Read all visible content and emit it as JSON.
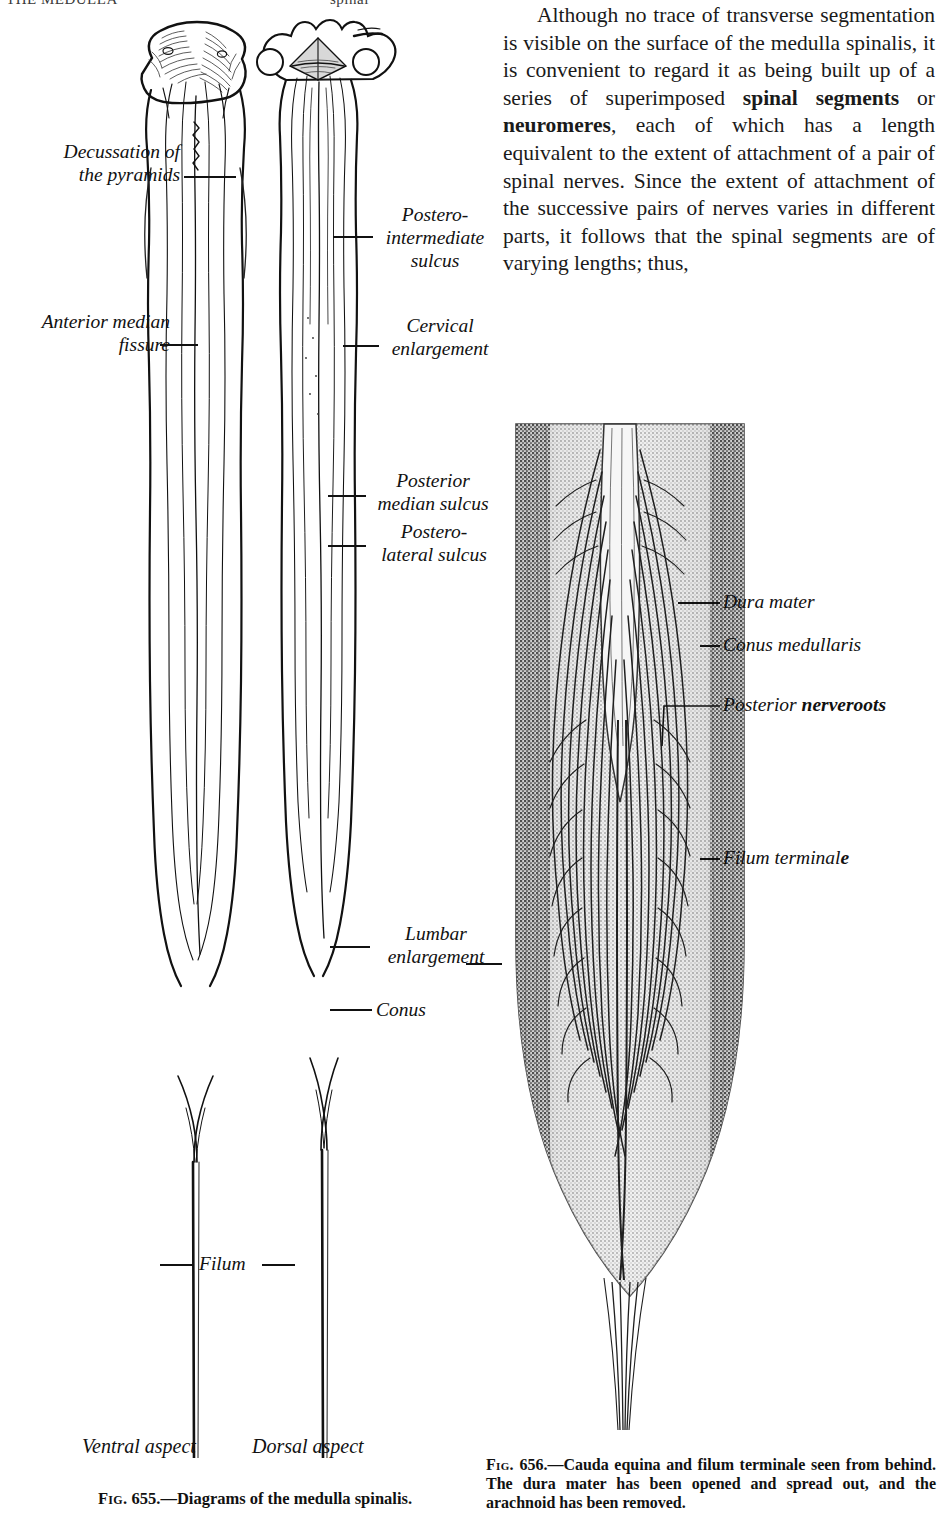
{
  "page": {
    "running_header_left": "THE MEDULLA",
    "running_header_right": "spinal"
  },
  "body_text": {
    "paragraph_html": "Although no trace of transverse segmentation is visible on the surface of the medulla spinalis, it is convenient to regard it as being built up of a series of superimposed <b>spinal segments</b> or <b>neuromeres</b>, each of which has a length equivalent to the extent of attachment of a pair of spinal nerves. Since the extent of attachment of the successive pairs of nerves varies in different parts, it follows that the spinal segments are of varying lengths; thus,"
  },
  "figure_655": {
    "caption_prefix": "Fig.",
    "caption_number": "655.",
    "caption_text": "—Diagrams of the medulla spinalis.",
    "aspect_left": "Ventral aspect",
    "aspect_right": "Dorsal aspect",
    "labels": {
      "decussation": "Decussation of\nthe pyramids",
      "decussation_line1": "Decussation of",
      "decussation_line2": "the pyramids",
      "anterior_median_line1": "Anterior median",
      "anterior_median_line2": "fissure",
      "postero_intermediate_line1": "Postero-",
      "postero_intermediate_line2": "intermediate",
      "postero_intermediate_line3": "sulcus",
      "cervical_line1": "Cervical",
      "cervical_line2": "enlargement",
      "posterior_median_line1": "Posterior",
      "posterior_median_line2": "median sulcus",
      "postero_lateral_line1": "Postero-",
      "postero_lateral_line2": "lateral sulcus",
      "lumbar_line1": "Lumbar",
      "lumbar_line2": "enlargement",
      "conus": "Conus",
      "filum": "Filum"
    }
  },
  "figure_656": {
    "caption_prefix": "Fig.",
    "caption_number": "656.",
    "caption_text": "—Cauda equina and filum terminale seen from behind. The dura mater has been opened and spread out, and the arachnoid has been removed.",
    "labels": {
      "dura_mater": "Dura mater",
      "conus_medullaris": "Conus medullaris",
      "posterior_nerveroots_plain": "Posterior ",
      "posterior_nerveroots_bold": "nerveroots",
      "filum_terminale_plain": "Filum terminal",
      "filum_terminale_bold": "e"
    }
  },
  "colors": {
    "ink": "#111111",
    "paper": "#ffffff",
    "halftone_dark": "#555555",
    "halftone_mid": "#8a8a8a"
  }
}
